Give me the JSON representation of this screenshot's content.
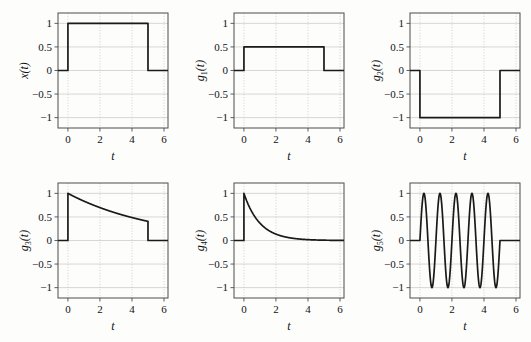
{
  "figure": {
    "background": "#fdfdfc",
    "curve_color": "#1a1a1a",
    "axis_color": "#4d4d4d",
    "grid_color": "#bdbdbd",
    "rows": 2,
    "cols": 3
  },
  "axes": {
    "x": {
      "label": "t",
      "ticks": [
        0,
        2,
        4,
        6
      ],
      "tick_labels": [
        "0",
        "2",
        "4",
        "6"
      ],
      "lim": [
        -0.62,
        6.25
      ]
    },
    "y": {
      "ticks": [
        -1,
        -0.5,
        0,
        0.5,
        1
      ],
      "tick_labels": [
        "−1",
        "−0.5",
        "0",
        "0.5",
        "1"
      ],
      "lim": [
        -1.22,
        1.22
      ]
    }
  },
  "chart_data": [
    {
      "type": "line",
      "panel_index": 0,
      "title": "",
      "ylabel": "x(t)",
      "ylabel_parts": {
        "base": "x",
        "sub": "",
        "suffix": "(t)"
      },
      "xlabel": "t",
      "xlim": [
        -0.62,
        6.25
      ],
      "ylim": [
        -1.22,
        1.22
      ],
      "xticks": [
        0,
        2,
        4,
        6
      ],
      "yticks": [
        -1,
        -0.5,
        0,
        0.5,
        1
      ],
      "grid": true,
      "legend": "none",
      "description": "unit rectangular pulse, amplitude 1 from t=0 to t=5",
      "x": [
        -0.62,
        0,
        0,
        5,
        5,
        6.25
      ],
      "y": [
        0,
        0,
        1,
        1,
        0,
        0
      ]
    },
    {
      "type": "line",
      "panel_index": 1,
      "title": "",
      "ylabel": "g1(t)",
      "ylabel_parts": {
        "base": "g",
        "sub": "1",
        "suffix": "(t)"
      },
      "xlabel": "t",
      "xlim": [
        -0.62,
        6.25
      ],
      "ylim": [
        -1.22,
        1.22
      ],
      "xticks": [
        0,
        2,
        4,
        6
      ],
      "yticks": [
        -1,
        -0.5,
        0,
        0.5,
        1
      ],
      "grid": true,
      "legend": "none",
      "description": "rectangular pulse, amplitude 0.5 from t=0 to t=5",
      "x": [
        -0.62,
        0,
        0,
        5,
        5,
        6.25
      ],
      "y": [
        0,
        0,
        0.5,
        0.5,
        0,
        0
      ]
    },
    {
      "type": "line",
      "panel_index": 2,
      "title": "",
      "ylabel": "g2(t)",
      "ylabel_parts": {
        "base": "g",
        "sub": "2",
        "suffix": "(t)"
      },
      "xlabel": "t",
      "xlim": [
        -0.62,
        6.25
      ],
      "ylim": [
        -1.22,
        1.22
      ],
      "xticks": [
        0,
        2,
        4,
        6
      ],
      "yticks": [
        -1,
        -0.5,
        0,
        0.5,
        1
      ],
      "grid": true,
      "legend": "none",
      "description": "inverted rectangular pulse, amplitude -1 from t=0 to t=5",
      "x": [
        -0.62,
        0,
        0,
        5,
        5,
        6.25
      ],
      "y": [
        0,
        0,
        -1,
        -1,
        0,
        0
      ]
    },
    {
      "type": "line",
      "panel_index": 3,
      "title": "",
      "ylabel": "g3(t)",
      "ylabel_parts": {
        "base": "g",
        "sub": "3",
        "suffix": "(t)"
      },
      "xlabel": "t",
      "xlim": [
        -0.62,
        6.25
      ],
      "ylim": [
        -1.22,
        1.22
      ],
      "xticks": [
        0,
        2,
        4,
        6
      ],
      "yticks": [
        -1,
        -0.5,
        0,
        0.5,
        1
      ],
      "grid": true,
      "legend": "none",
      "description": "slow exponential decay exp(-0.18t) gated from t=0 to t=5",
      "formula": "exp(-0.18*t)",
      "decay_rate": 0.18,
      "gate": [
        0,
        5
      ],
      "key_points": [
        {
          "t": 0,
          "y": 1
        },
        {
          "t": 1,
          "y": 0.84
        },
        {
          "t": 2,
          "y": 0.7
        },
        {
          "t": 3,
          "y": 0.58
        },
        {
          "t": 4,
          "y": 0.49
        },
        {
          "t": 5,
          "y": 0.41
        }
      ]
    },
    {
      "type": "line",
      "panel_index": 4,
      "title": "",
      "ylabel": "g4(t)",
      "ylabel_parts": {
        "base": "g",
        "sub": "4",
        "suffix": "(t)"
      },
      "xlabel": "t",
      "xlim": [
        -0.62,
        6.25
      ],
      "ylim": [
        -1.22,
        1.22
      ],
      "xticks": [
        0,
        2,
        4,
        6
      ],
      "yticks": [
        -1,
        -0.5,
        0,
        0.5,
        1
      ],
      "grid": true,
      "legend": "none",
      "description": "fast exponential decay exp(-t) starting at t=0",
      "formula": "exp(-1.0*t)",
      "decay_rate": 1.0,
      "gate": [
        0,
        6.25
      ],
      "key_points": [
        {
          "t": 0,
          "y": 1
        },
        {
          "t": 1,
          "y": 0.37
        },
        {
          "t": 2,
          "y": 0.14
        },
        {
          "t": 3,
          "y": 0.05
        },
        {
          "t": 4,
          "y": 0.02
        },
        {
          "t": 5,
          "y": 0.01
        },
        {
          "t": 6,
          "y": 0.0
        }
      ]
    },
    {
      "type": "line",
      "panel_index": 5,
      "title": "",
      "ylabel": "g5(t)",
      "ylabel_parts": {
        "base": "g",
        "sub": "5",
        "suffix": "(t)"
      },
      "xlabel": "t",
      "xlim": [
        -0.62,
        6.25
      ],
      "ylim": [
        -1.22,
        1.22
      ],
      "xticks": [
        0,
        2,
        4,
        6
      ],
      "yticks": [
        -1,
        -0.5,
        0,
        0.5,
        1
      ],
      "grid": true,
      "legend": "none",
      "description": "sinusoid sin(2*pi*t), amplitude 1, frequency 1 Hz, gated from t=0 to t=5 (5 cycles)",
      "formula": "sin(2*pi*t)",
      "amplitude": 1,
      "frequency_hz": 1,
      "cycles": 5,
      "gate": [
        0,
        5
      ],
      "key_points": [
        {
          "t": 0,
          "y": 0
        },
        {
          "t": 0.25,
          "y": 1
        },
        {
          "t": 0.75,
          "y": -1
        },
        {
          "t": 1.25,
          "y": 1
        },
        {
          "t": 1.75,
          "y": -1
        },
        {
          "t": 2.25,
          "y": 1
        },
        {
          "t": 2.75,
          "y": -1
        },
        {
          "t": 3.25,
          "y": 1
        },
        {
          "t": 3.75,
          "y": -1
        },
        {
          "t": 4.25,
          "y": 1
        },
        {
          "t": 4.75,
          "y": -1
        },
        {
          "t": 5,
          "y": 0
        }
      ]
    }
  ]
}
